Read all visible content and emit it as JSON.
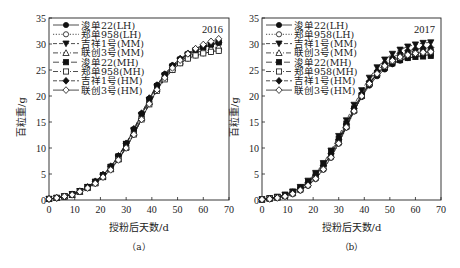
{
  "chart_data": [
    {
      "type": "line",
      "panel": "(a)",
      "title": "2016",
      "xlabel": "授粉后天数/d",
      "ylabel": "百粒重/g",
      "xlim": [
        0,
        70
      ],
      "ylim": [
        0,
        35
      ],
      "xticks": [
        0,
        10,
        20,
        30,
        40,
        50,
        60,
        70
      ],
      "yticks": [
        0,
        5,
        10,
        15,
        20,
        25,
        30,
        35
      ],
      "grid": false,
      "legend_position": "upper left",
      "x": [
        0,
        3,
        6,
        9,
        12,
        15,
        18,
        21,
        24,
        27,
        30,
        33,
        36,
        39,
        42,
        45,
        48,
        51,
        54,
        57,
        60,
        63,
        66
      ],
      "series": [
        {
          "name": "浚单22(LH)",
          "marker": "filled-circle",
          "line": "solid",
          "values": [
            0.2,
            0.4,
            0.7,
            1.1,
            1.7,
            2.5,
            3.5,
            4.8,
            6.4,
            8.4,
            10.8,
            13.6,
            16.6,
            19.5,
            22.1,
            24.2,
            25.9,
            27.1,
            28.0,
            28.7,
            29.3,
            29.8,
            30.2
          ]
        },
        {
          "name": "郑单958(LH)",
          "marker": "open-circle",
          "line": "dotted",
          "values": [
            0.2,
            0.4,
            0.7,
            1.0,
            1.6,
            2.3,
            3.2,
            4.4,
            5.9,
            7.8,
            10.1,
            12.7,
            15.6,
            18.5,
            21.1,
            23.3,
            25.0,
            26.3,
            27.2,
            27.8,
            28.2,
            28.5,
            28.7
          ]
        },
        {
          "name": "吉祥1号(MM)",
          "marker": "filled-triangle-down",
          "line": "dashed",
          "values": [
            0.2,
            0.4,
            0.7,
            1.1,
            1.7,
            2.5,
            3.5,
            4.7,
            6.3,
            8.3,
            10.7,
            13.4,
            16.3,
            19.2,
            21.8,
            23.9,
            25.6,
            26.9,
            27.9,
            28.7,
            29.3,
            29.8,
            30.1
          ]
        },
        {
          "name": "联创3号(MM)",
          "marker": "open-triangle-up",
          "line": "dash-dot",
          "values": [
            0.2,
            0.4,
            0.7,
            1.0,
            1.6,
            2.4,
            3.3,
            4.5,
            6.0,
            7.9,
            10.2,
            12.9,
            15.8,
            18.8,
            21.4,
            23.6,
            25.3,
            26.6,
            27.6,
            28.3,
            28.8,
            29.2,
            29.5
          ]
        },
        {
          "name": "浚单22(MH)",
          "marker": "filled-square",
          "line": "long-dash",
          "values": [
            0.2,
            0.4,
            0.7,
            1.1,
            1.7,
            2.5,
            3.5,
            4.8,
            6.4,
            8.4,
            10.8,
            13.5,
            16.4,
            19.3,
            21.9,
            24.0,
            25.7,
            27.0,
            28.0,
            28.8,
            29.4,
            29.9,
            30.3
          ]
        },
        {
          "name": "郑单958(MH)",
          "marker": "open-square",
          "line": "dash-dot",
          "values": [
            0.2,
            0.4,
            0.7,
            1.0,
            1.6,
            2.3,
            3.2,
            4.4,
            5.9,
            7.8,
            10.0,
            12.6,
            15.5,
            18.4,
            21.0,
            23.2,
            25.0,
            26.3,
            27.2,
            27.8,
            28.2,
            28.5,
            28.7
          ]
        },
        {
          "name": "吉祥1号(HM)",
          "marker": "filled-diamond",
          "line": "dashed",
          "values": [
            0.2,
            0.4,
            0.7,
            1.1,
            1.7,
            2.5,
            3.6,
            4.9,
            6.5,
            8.5,
            10.9,
            13.7,
            16.7,
            19.6,
            22.1,
            24.2,
            25.9,
            27.2,
            28.2,
            29.0,
            29.6,
            30.0,
            30.3
          ]
        },
        {
          "name": "联创3号(HM)",
          "marker": "open-diamond",
          "line": "solid",
          "values": [
            0.2,
            0.4,
            0.7,
            1.0,
            1.6,
            2.3,
            3.2,
            4.4,
            5.8,
            7.7,
            10.0,
            12.6,
            15.5,
            18.5,
            21.2,
            23.5,
            25.4,
            26.9,
            28.1,
            29.1,
            29.9,
            30.5,
            31.0
          ]
        }
      ]
    },
    {
      "type": "line",
      "panel": "(b)",
      "title": "2017",
      "xlabel": "授粉后天数/d",
      "ylabel": "百粒重/g",
      "xlim": [
        0,
        70
      ],
      "ylim": [
        0,
        35
      ],
      "xticks": [
        0,
        10,
        20,
        30,
        40,
        50,
        60,
        70
      ],
      "yticks": [
        0,
        5,
        10,
        15,
        20,
        25,
        30,
        35
      ],
      "grid": false,
      "legend_position": "upper left",
      "x": [
        0,
        3,
        6,
        9,
        12,
        15,
        18,
        21,
        24,
        27,
        30,
        33,
        36,
        39,
        42,
        45,
        48,
        51,
        54,
        57,
        60,
        63,
        66
      ],
      "series": [
        {
          "name": "浚单22(LH)",
          "marker": "filled-circle",
          "line": "solid",
          "values": [
            0.1,
            0.3,
            0.5,
            0.9,
            1.5,
            2.3,
            3.3,
            4.7,
            6.5,
            8.8,
            11.4,
            14.3,
            17.2,
            19.8,
            22.0,
            23.8,
            25.1,
            26.1,
            26.8,
            27.3,
            27.6,
            27.8,
            27.9
          ]
        },
        {
          "name": "郑单958(LH)",
          "marker": "open-circle",
          "line": "dotted",
          "values": [
            0.1,
            0.2,
            0.4,
            0.7,
            1.1,
            1.8,
            2.7,
            4.0,
            5.8,
            8.1,
            10.8,
            13.9,
            17.0,
            19.9,
            22.3,
            24.2,
            25.6,
            26.6,
            27.3,
            27.8,
            28.1,
            28.3,
            28.4
          ]
        },
        {
          "name": "吉祥1号(MM)",
          "marker": "filled-triangle-down",
          "line": "dashed",
          "values": [
            0.1,
            0.3,
            0.6,
            1.0,
            1.6,
            2.5,
            3.7,
            5.2,
            7.1,
            9.5,
            12.3,
            15.3,
            18.3,
            21.1,
            23.5,
            25.5,
            27.0,
            28.1,
            28.9,
            29.5,
            29.9,
            30.2,
            30.3
          ]
        },
        {
          "name": "联创3号(MM)",
          "marker": "open-triangle-up",
          "line": "dash-dot",
          "values": [
            0.1,
            0.3,
            0.5,
            0.9,
            1.4,
            2.2,
            3.2,
            4.6,
            6.4,
            8.7,
            11.3,
            14.3,
            17.3,
            20.1,
            22.5,
            24.4,
            25.9,
            27.0,
            27.8,
            28.3,
            28.7,
            29.0,
            29.1
          ]
        },
        {
          "name": "浚单22(MH)",
          "marker": "filled-square",
          "line": "long-dash",
          "values": [
            0.1,
            0.3,
            0.6,
            1.0,
            1.6,
            2.4,
            3.5,
            5.0,
            6.9,
            9.2,
            11.8,
            14.7,
            17.6,
            20.2,
            22.4,
            24.1,
            25.4,
            26.3,
            26.9,
            27.3,
            27.5,
            27.6,
            27.7
          ]
        },
        {
          "name": "郑单958(MH)",
          "marker": "open-square",
          "line": "dash-dot",
          "values": [
            0.1,
            0.3,
            0.5,
            0.8,
            1.3,
            2.0,
            3.0,
            4.3,
            6.1,
            8.4,
            11.1,
            14.1,
            17.2,
            20.0,
            22.4,
            24.3,
            25.7,
            26.7,
            27.4,
            27.9,
            28.2,
            28.4,
            28.5
          ]
        },
        {
          "name": "吉祥1号(HM)",
          "marker": "filled-diamond",
          "line": "dashed",
          "values": [
            0.1,
            0.3,
            0.5,
            0.9,
            1.5,
            2.3,
            3.4,
            4.8,
            6.6,
            8.9,
            11.6,
            14.6,
            17.6,
            20.4,
            22.8,
            24.8,
            26.3,
            27.4,
            28.2,
            28.7,
            29.0,
            29.2,
            29.3
          ]
        },
        {
          "name": "联创3号(HM)",
          "marker": "open-diamond",
          "line": "solid",
          "values": [
            0.1,
            0.2,
            0.4,
            0.7,
            1.2,
            1.9,
            2.8,
            4.1,
            5.9,
            8.2,
            10.9,
            14.0,
            17.1,
            20.0,
            22.4,
            24.3,
            25.8,
            26.8,
            27.5,
            27.9,
            28.2,
            28.4,
            28.5
          ]
        }
      ]
    }
  ],
  "panels": [
    {
      "caption": "（a）",
      "year": "2016",
      "xlabel": "授粉后天数/d",
      "ylabel": "百粒重/g"
    },
    {
      "caption": "（b）",
      "year": "2017",
      "xlabel": "授粉后天数/d",
      "ylabel": "百粒重/g"
    }
  ]
}
